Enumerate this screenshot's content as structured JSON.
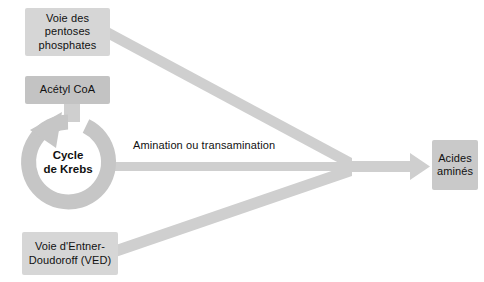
{
  "diagram": {
    "background_color": "#ffffff",
    "arrow_color": "#cfcfcf",
    "ring_color": "#c6c6c6",
    "text_color": "#111111"
  },
  "nodes": {
    "pentoses": {
      "label": "Voie des pentoses phosphates",
      "line1": "Voie des",
      "line2": "pentoses",
      "line3": "phosphates",
      "fill": "#d6d6d6"
    },
    "acetyl_coa": {
      "label": "Acétyl CoA",
      "fill": "#c3c3c3"
    },
    "ved": {
      "label": "Voie d'Entner-Doudoroff (VED)",
      "line1": "Voie d'Entner-",
      "line2": "Doudoroff (VED)",
      "fill": "#d6d6d6"
    },
    "acides_amines": {
      "label": "Acides aminés",
      "line1": "Acides",
      "line2": "aminés",
      "fill": "#c9c9c9"
    },
    "krebs": {
      "line1": "Cycle",
      "line2": "de Krebs",
      "label": "Cycle de Krebs",
      "fill": "#c6c6c6"
    }
  },
  "edges": {
    "amination": {
      "label": "Amination ou transamination"
    },
    "pentoses_to_junction": {
      "label": ""
    },
    "krebs_to_junction": {
      "label": ""
    },
    "ved_to_junction": {
      "label": ""
    },
    "junction_to_acides": {
      "label": ""
    },
    "acetylcoa_to_krebs": {
      "label": ""
    }
  }
}
